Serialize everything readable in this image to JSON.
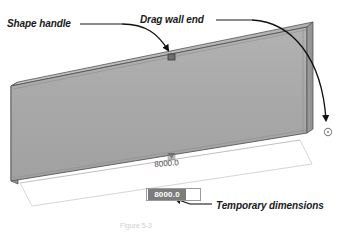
{
  "figure": {
    "background_color": "#ffffff"
  },
  "callouts": [
    {
      "name": "shape-handle",
      "label": "Shape handle"
    },
    {
      "name": "drag-wall-end",
      "label": "Drag wall end"
    },
    {
      "name": "temporary-dimensions",
      "label": "Temporary dimensions"
    }
  ],
  "dimensions": {
    "top_value": "8000.0",
    "selected_value": "8000.0",
    "selected": true
  },
  "caption": {
    "text": "Figure 5-3"
  },
  "model": {
    "object": "wall",
    "face_color": "#a9a9a9",
    "top_color": "#bcbcbc",
    "end_color": "#9a9a9a",
    "outline_color": "#4a4a4a",
    "handle_square_color": "#5a5a5a",
    "handle_circle_color": "#8a8a8a"
  }
}
